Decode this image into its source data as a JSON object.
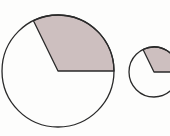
{
  "figure": {
    "circles": [
      {
        "name": "large-circle",
        "sector_start_deg": 0,
        "sector_end_deg": 116
      },
      {
        "name": "small-circle",
        "sector_start_deg": 0,
        "sector_end_deg": 116
      }
    ],
    "colors": {
      "sector_fill": "#cdbfbf",
      "stroke": "#2a2a2a",
      "background": "#fdfdfc"
    }
  }
}
